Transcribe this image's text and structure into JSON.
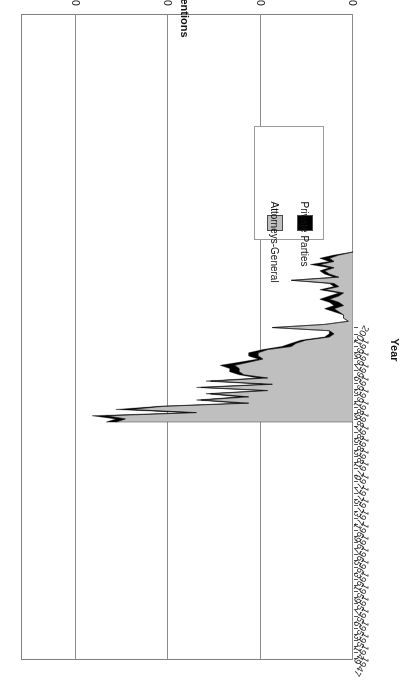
{
  "chart_data": {
    "type": "area",
    "stacked": true,
    "title": "",
    "xlabel": "Year",
    "ylabel": "Number of Interventions",
    "ylim": [
      0,
      70
    ],
    "yticks": [
      0,
      10,
      20,
      30,
      40,
      50,
      60,
      70
    ],
    "xlim": [
      1947,
      2001
    ],
    "grid": "vertical-only",
    "orientation": "rotated-180",
    "legend_position": "middle-left",
    "x": [
      1947,
      1948,
      1949,
      1950,
      1951,
      1952,
      1953,
      1954,
      1955,
      1956,
      1957,
      1958,
      1959,
      1960,
      1961,
      1962,
      1963,
      1964,
      1965,
      1966,
      1967,
      1968,
      1969,
      1970,
      1971,
      1972,
      1973,
      1974,
      1975,
      1976,
      1977,
      1978,
      1979,
      1980,
      1981,
      1982,
      1983,
      1984,
      1985,
      1986,
      1987,
      1988,
      1989,
      1990,
      1991,
      1992,
      1993,
      1994,
      1995,
      1996,
      1997,
      1998,
      1999,
      2000,
      2001
    ],
    "series": [
      {
        "name": "Attorneys-General",
        "color": "#bfbfbf",
        "values": [
          0,
          3,
          5,
          4,
          7,
          4,
          6,
          5,
          3,
          13,
          4,
          3,
          6,
          2,
          3,
          5,
          3,
          2,
          4,
          3,
          2,
          2,
          1,
          6,
          17,
          5,
          4,
          5,
          10,
          12,
          13,
          18,
          20,
          20,
          19,
          22,
          25,
          24,
          24,
          23,
          18,
          30,
          17,
          32,
          18,
          30,
          22,
          32,
          22,
          40,
          47,
          33,
          52,
          48,
          50
        ]
      },
      {
        "name": "Private Parties",
        "color": "#000000",
        "values": [
          0,
          1,
          2,
          1,
          2,
          1,
          1,
          1,
          1,
          0,
          1,
          1,
          1,
          1,
          2,
          2,
          2,
          2,
          2,
          1,
          0,
          0,
          0,
          0,
          0,
          0,
          1,
          1,
          1,
          1,
          2,
          1,
          2,
          2,
          1,
          2,
          3,
          2,
          2,
          1,
          2,
          1,
          2,
          1,
          1,
          1,
          2,
          1,
          2,
          1,
          3,
          2,
          3,
          2,
          2
        ]
      }
    ],
    "legend": [
      {
        "label": "Private Parties",
        "color": "#000000"
      },
      {
        "label": "Attorneys-General",
        "color": "#bfbfbf"
      }
    ],
    "xticks": [
      "1947",
      "1949",
      "1951",
      "1953",
      "1955",
      "1957",
      "1959",
      "1961",
      "1963",
      "1965",
      "1967",
      "1969",
      "1971",
      "1973",
      "1975",
      "1977",
      "1979",
      "1981",
      "1983",
      "1985",
      "1987",
      "1989",
      "1991",
      "1993",
      "1995",
      "1997",
      "1999",
      "2001"
    ]
  }
}
